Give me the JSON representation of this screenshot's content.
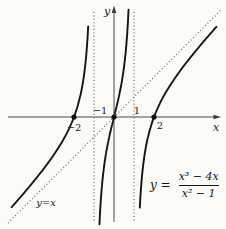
{
  "chart_data": {
    "type": "line",
    "equation": "y = (x³ − 4x)/(x² − 1)",
    "equation_display": {
      "lhs": "y =",
      "numerator": "x³ − 4x",
      "denominator": "x² − 1"
    },
    "xlabel": "x",
    "ylabel": "y",
    "xlim": [
      -5.3,
      5.4
    ],
    "ylim": [
      -5.6,
      5.6
    ],
    "grid": false,
    "legend": "none",
    "function": {
      "numerator_coeffs": [
        1,
        0,
        -4,
        0
      ],
      "denominator_coeffs": [
        1,
        0,
        -1
      ]
    },
    "branches": [
      {
        "name": "left",
        "x_range": [
          -5.12,
          -1.2
        ],
        "y_clip": 4.75
      },
      {
        "name": "middle",
        "x_range": [
          -0.745,
          0.745
        ],
        "y_clip": 5.45
      },
      {
        "name": "right",
        "x_range": [
          1.2,
          5.12
        ],
        "y_clip": 4.75
      }
    ],
    "vertical_asymptotes": [
      -1,
      1
    ],
    "oblique_asymptote": {
      "label": "y=x",
      "slope": 1,
      "intercept": 0,
      "x_range": [
        -5.3,
        5.35
      ]
    },
    "x_intercepts": [
      -2,
      0,
      2
    ],
    "points": [
      {
        "x": -2,
        "y": 0
      },
      {
        "x": 0,
        "y": 0
      },
      {
        "x": 2,
        "y": 0
      }
    ],
    "tick_labels": [
      {
        "axis": "x",
        "value": -2,
        "text": "−2"
      },
      {
        "axis": "x",
        "value": -1,
        "text": "−1"
      },
      {
        "axis": "x",
        "value": 1,
        "text": "1"
      },
      {
        "axis": "x",
        "value": 2,
        "text": "2"
      }
    ],
    "layout": {
      "origin_px": [
        114,
        117
      ],
      "px_per_unit": 20
    }
  }
}
